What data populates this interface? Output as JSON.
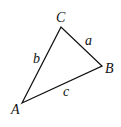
{
  "diagram": {
    "type": "triangle",
    "stroke_color": "#111111",
    "vertices": [
      {
        "label": "A",
        "x": 22,
        "y": 103,
        "label_x": 11,
        "label_y": 114
      },
      {
        "label": "B",
        "x": 102,
        "y": 66,
        "label_x": 106,
        "label_y": 73
      },
      {
        "label": "C",
        "x": 61,
        "y": 27,
        "label_x": 56,
        "label_y": 22
      }
    ],
    "sides": [
      {
        "label": "a",
        "from": "C",
        "to": "B",
        "label_x": 85,
        "label_y": 45
      },
      {
        "label": "b",
        "from": "A",
        "to": "C",
        "label_x": 34,
        "label_y": 63
      },
      {
        "label": "c",
        "from": "A",
        "to": "B",
        "label_x": 63,
        "label_y": 95
      }
    ]
  }
}
